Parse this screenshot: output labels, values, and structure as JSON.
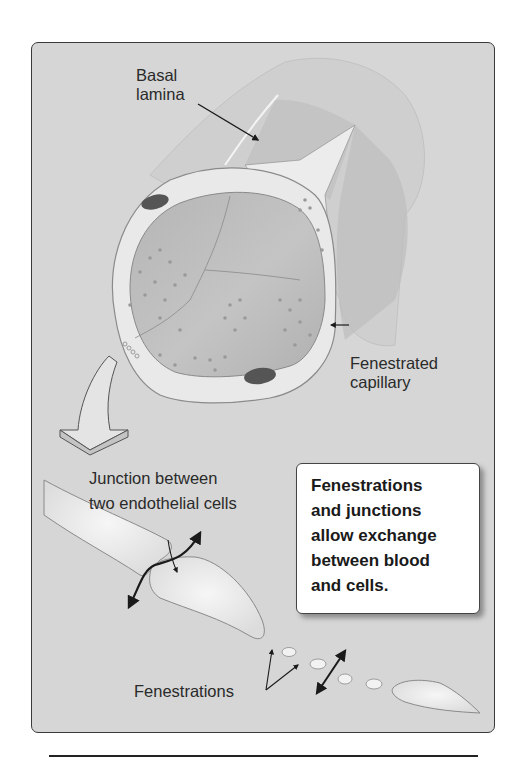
{
  "figure": {
    "labels": {
      "basal_lamina": "Basal\nlamina",
      "fenestrated_capillary": "Fenestrated\ncapillary",
      "junction": "Junction between\ntwo endothelial cells",
      "fenestrations": "Fenestrations"
    },
    "callout": "Fenestrations\nand junctions\nallow exchange\nbetween blood\nand cells.",
    "colors": {
      "panel_bg": "#d6d6d6",
      "cell_fill": "#e8e8e8",
      "lumen_fill": "#b8b8b8",
      "nucleus": "#555555",
      "outline": "#8a8a8a",
      "arrow": "#1a1a1a"
    }
  }
}
